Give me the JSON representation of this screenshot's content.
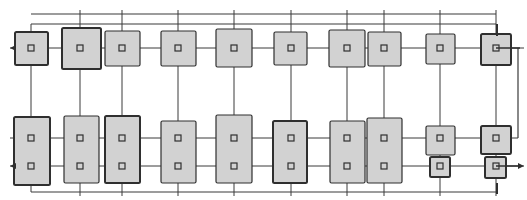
{
  "diagram": {
    "type": "structural-grid-plan",
    "colors": {
      "background": "#ffffff",
      "line": "#3a3a3a",
      "fill": "#d2d2d2",
      "stroke": "#2f2f2f"
    },
    "grid": {
      "columns_x": [
        31,
        80,
        122,
        178,
        234,
        291,
        347,
        384,
        440,
        496
      ],
      "top_dim_lines_y": [
        14,
        24
      ],
      "rows_y": [
        48,
        138,
        166
      ],
      "bottom_line_y": 192,
      "right_line_x": 518
    },
    "top_row": [
      {
        "x": 15,
        "y": 32,
        "w": 33,
        "h": 33,
        "bold": true
      },
      {
        "x": 62,
        "y": 28,
        "w": 39,
        "h": 41,
        "bold": true
      },
      {
        "x": 105,
        "y": 31,
        "w": 35,
        "h": 35,
        "bold": false
      },
      {
        "x": 161,
        "y": 31,
        "w": 35,
        "h": 35,
        "bold": false
      },
      {
        "x": 216,
        "y": 29,
        "w": 36,
        "h": 38,
        "bold": false
      },
      {
        "x": 274,
        "y": 32,
        "w": 33,
        "h": 33,
        "bold": false
      },
      {
        "x": 329,
        "y": 30,
        "w": 36,
        "h": 37,
        "bold": false
      },
      {
        "x": 368,
        "y": 32,
        "w": 33,
        "h": 34,
        "bold": false
      },
      {
        "x": 426,
        "y": 34,
        "w": 29,
        "h": 30,
        "bold": false
      },
      {
        "x": 481,
        "y": 34,
        "w": 30,
        "h": 31,
        "bold": true
      }
    ],
    "bottom_row": [
      {
        "x": 14,
        "y": 117,
        "w": 36,
        "h": 68,
        "bold": true
      },
      {
        "x": 64,
        "y": 116,
        "w": 35,
        "h": 67,
        "bold": false
      },
      {
        "x": 105,
        "y": 116,
        "w": 35,
        "h": 67,
        "bold": true
      },
      {
        "x": 161,
        "y": 121,
        "w": 35,
        "h": 62,
        "bold": false
      },
      {
        "x": 216,
        "y": 115,
        "w": 36,
        "h": 68,
        "bold": false
      },
      {
        "x": 273,
        "y": 121,
        "w": 34,
        "h": 62,
        "bold": true
      },
      {
        "x": 330,
        "y": 121,
        "w": 35,
        "h": 62,
        "bold": false
      },
      {
        "x": 367,
        "y": 118,
        "w": 35,
        "h": 65,
        "bold": false
      },
      {
        "x": 426,
        "y": 126,
        "w": 29,
        "h": 29,
        "bold": false
      },
      {
        "x": 481,
        "y": 126,
        "w": 30,
        "h": 28,
        "bold": true
      },
      {
        "x": 430,
        "y": 157,
        "w": 20,
        "h": 20,
        "bold": true
      },
      {
        "x": 485,
        "y": 157,
        "w": 21,
        "h": 21,
        "bold": true
      }
    ]
  }
}
